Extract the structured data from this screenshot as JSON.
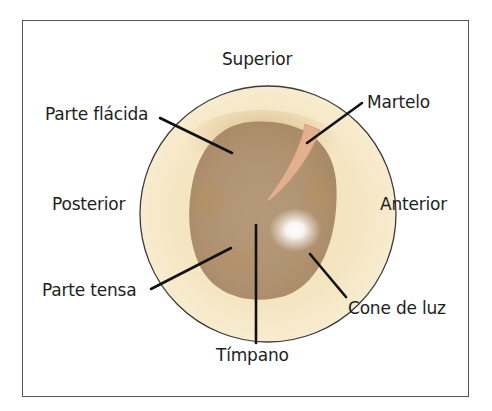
{
  "orientation": {
    "top": "Superior",
    "left": "Posterior",
    "right": "Anterior"
  },
  "labels": {
    "parte_flacida": "Parte flácida",
    "martelo": "Martelo",
    "parte_tensa": "Parte tensa",
    "cone_de_luz": "Cone de luz",
    "timpano": "Tímpano"
  },
  "colors": {
    "outer_ring": "#f6e8c6",
    "outer_ring_stroke": "#3a3a3a",
    "membrane": "#b59a76",
    "membrane_dark": "#a8875f",
    "malleus": "#e2b08f",
    "light_reflex": "#ffffff",
    "leader_line": "#111111"
  }
}
